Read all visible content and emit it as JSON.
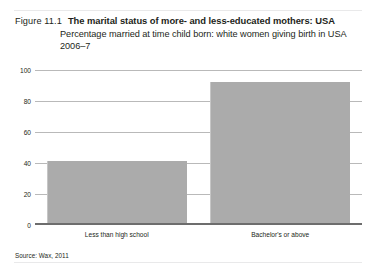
{
  "figure": {
    "number": "Figure 11.1",
    "title": "The marital status of more- and less-educated mothers: USA",
    "subtitle": "Percentage married at time child born: white women giving birth in USA 2006–7",
    "source": "Source: Wax, 2011"
  },
  "chart_data": {
    "type": "bar",
    "title": "The marital status of more- and less-educated mothers: USA",
    "subtitle": "Percentage married at time child born: white women giving birth in USA 2006–7",
    "categories": [
      "Less than high school",
      "Bachelor's or above"
    ],
    "values": [
      41,
      92
    ],
    "xlabel": "",
    "ylabel": "",
    "ylim": [
      0,
      100
    ],
    "yticks": [
      0,
      20,
      40,
      60,
      80,
      100
    ],
    "ytick_labels": [
      "0",
      "20",
      "40",
      "60",
      "80",
      "100"
    ],
    "grid": true,
    "legend": false,
    "bar_color": "#ababab",
    "gridline_color": "#b9b9b9",
    "axis_color": "#6d6d6d",
    "source": "Source: Wax, 2011"
  }
}
